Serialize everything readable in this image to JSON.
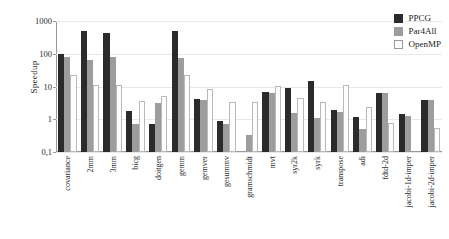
{
  "chart_data": {
    "type": "bar",
    "title": "",
    "xlabel": "",
    "ylabel": "Speedup",
    "yscale": "log",
    "ylim": [
      0.1,
      1000
    ],
    "ytick_labels": [
      "1000",
      "100",
      "10",
      "1",
      "0,1"
    ],
    "ytick_values": [
      1000,
      100,
      10,
      1,
      0.1
    ],
    "grid": true,
    "legend_position": "top-right",
    "categories": [
      "covariance",
      "2mm",
      "3mm",
      "bicg",
      "doitgen",
      "gemm",
      "gemver",
      "gesummv",
      "gramschmidt",
      "mvt",
      "syr2k",
      "syrk",
      "transpose",
      "adi",
      "fdtd-2d",
      "jacobi-1d-imper",
      "jacobi-2d-imper"
    ],
    "series": [
      {
        "name": "PPCG",
        "color": "#2b2b2b",
        "values": [
          95,
          480,
          430,
          1.8,
          0.72,
          490,
          4.3,
          0.87,
          null,
          6.6,
          9.2,
          14.5,
          1.9,
          1.2,
          6.4,
          1.45,
          4.0
        ]
      },
      {
        "name": "Par4All",
        "color": "#9d9d9d",
        "values": [
          80,
          65,
          78,
          0.74,
          3.2,
          73,
          4.0,
          0.73,
          0.33,
          6.3,
          1.5,
          1.1,
          1.65,
          0.52,
          6.3,
          1.25,
          3.9
        ]
      },
      {
        "name": "OpenMP",
        "color": "#fdfdfd",
        "values": [
          23,
          11,
          11,
          3.7,
          5.1,
          23,
          8.2,
          3.4,
          3.4,
          10.5,
          4.5,
          3.4,
          11,
          2.4,
          0.75,
          null,
          0.55
        ]
      }
    ]
  },
  "legend": {
    "items": [
      {
        "label": "PPCG"
      },
      {
        "label": "Par4All"
      },
      {
        "label": "OpenMP"
      }
    ]
  }
}
